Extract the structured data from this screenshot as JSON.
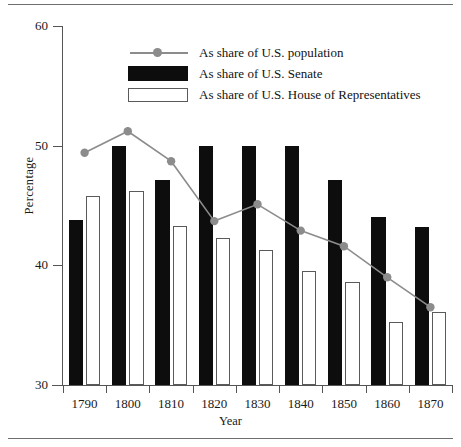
{
  "chart_data": {
    "type": "bar",
    "title": "",
    "subtitle": "",
    "xlabel": "Year",
    "ylabel": "Percentage",
    "categories": [
      "1790",
      "1800",
      "1810",
      "1820",
      "1830",
      "1840",
      "1850",
      "1860",
      "1870"
    ],
    "ylim": [
      30,
      60
    ],
    "yticks": [
      30,
      40,
      50,
      60
    ],
    "ytick_labels": [
      "30",
      "40",
      "50",
      "60"
    ],
    "grid": false,
    "legend_position": "top-center",
    "series": [
      {
        "name": "As share of U.S. population",
        "type": "line",
        "marker": "circle",
        "color": "#8c8c8c",
        "values": [
          49.4,
          51.2,
          48.7,
          43.7,
          45.1,
          42.9,
          41.6,
          39.0,
          36.5
        ]
      },
      {
        "name": "As share of U.S. Senate",
        "type": "bar",
        "color": "#0d0d0d",
        "values": [
          43.8,
          50.0,
          47.1,
          50.0,
          50.0,
          50.0,
          47.1,
          44.0,
          43.2
        ]
      },
      {
        "name": "As share of U.S. House of Representatives",
        "type": "bar",
        "color": "#ffffff",
        "edge_color": "#5a5a5a",
        "values": [
          45.8,
          46.2,
          43.3,
          42.3,
          41.3,
          39.5,
          38.6,
          35.3,
          36.1
        ]
      }
    ]
  },
  "axes": {
    "y_title": "Percentage",
    "x_title": "Year"
  },
  "legend": {
    "items": [
      {
        "label": "As share of U.S. population",
        "key": "line-marker-key"
      },
      {
        "label": "As share of U.S. Senate",
        "key": "black-swatch-key"
      },
      {
        "label": "As share of U.S. House of Representatives",
        "key": "white-swatch-key"
      }
    ]
  },
  "colors": {
    "line": "#8c8c8c",
    "senate_bar": "#0d0d0d",
    "house_bar_fill": "#ffffff",
    "house_bar_edge": "#5a5a5a",
    "axis": "#555555",
    "rule": "#6e6e6e"
  }
}
